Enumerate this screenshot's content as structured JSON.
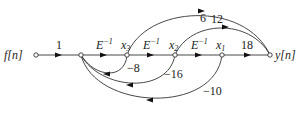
{
  "diagram": {
    "type": "signal-flow-graph",
    "nodes": {
      "input": "f[n]",
      "x3": "x",
      "x3_sub": "3",
      "x2": "x",
      "x2_sub": "2",
      "x1": "x",
      "x1_sub": "1",
      "output": "y[n]"
    },
    "forward_gains": {
      "input_gain": "1",
      "delay1": "E",
      "delay1_exp": "−1",
      "delay2": "E",
      "delay2_exp": "−1",
      "delay3": "E",
      "delay3_exp": "−1",
      "x1_to_y": "18"
    },
    "feedforward_gains": {
      "x3_to_y": "6",
      "x2_to_y": "12"
    },
    "feedback_gains": {
      "x3_fb": "−8",
      "x2_fb": "−16",
      "x1_fb": "−10"
    }
  }
}
